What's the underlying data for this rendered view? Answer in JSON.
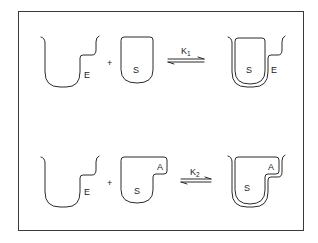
{
  "figure": {
    "type": "enzyme-substrate binding diagram (lock and key)",
    "rows": [
      {
        "id": "reaction-1",
        "enzyme_label": "E",
        "plus": "+",
        "substrate_label": "S",
        "constant": {
          "symbol": "K",
          "subscript": "1"
        },
        "complex_labels": [
          "S",
          "E"
        ]
      },
      {
        "id": "reaction-2",
        "enzyme_label": "E",
        "plus": "+",
        "substrate_labels": [
          "A",
          "S"
        ],
        "constant": {
          "symbol": "K",
          "subscript": "2"
        },
        "complex_labels": [
          "A",
          "S"
        ]
      }
    ]
  },
  "colors": {
    "line": "#2a2a2a",
    "background": "#ffffff",
    "frame": "#3a3a3a"
  }
}
